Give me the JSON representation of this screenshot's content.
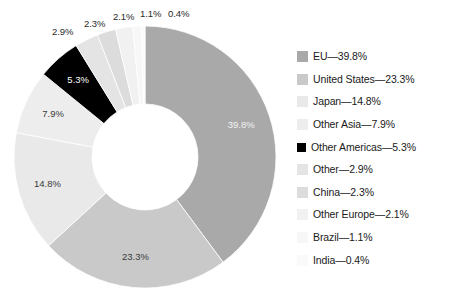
{
  "chart_data": {
    "type": "pie",
    "variant": "donut",
    "title": "",
    "subtitle": "",
    "xlabel": "",
    "ylabel": "",
    "grid": false,
    "legend_position": "right",
    "unit": "%",
    "start_angle_deg": 0,
    "direction": "clockwise",
    "categories": [
      "EU",
      "United States",
      "Japan",
      "Other Asia",
      "Other Americas",
      "Other",
      "China",
      "Other Europe",
      "Brazil",
      "India"
    ],
    "values": [
      39.8,
      23.3,
      14.8,
      7.9,
      5.3,
      2.9,
      2.3,
      2.1,
      1.1,
      0.4
    ],
    "value_labels": [
      "39.8%",
      "23.3%",
      "14.8%",
      "7.9%",
      "5.3%",
      "2.9%",
      "2.3%",
      "2.1%",
      "1.1%",
      "0.4%"
    ],
    "colors": [
      "#a9a9a9",
      "#c9c9c9",
      "#e9e9e9",
      "#ededed",
      "#000000",
      "#e4e4e4",
      "#dcdcdc",
      "#f1f1f1",
      "#f7f7f7",
      "#fafafa"
    ],
    "legend_entries": [
      "EU—39.8%",
      "United States—23.3%",
      "Japan—14.8%",
      "Other Asia—7.9%",
      "Other Americas—5.3%",
      "Other—2.9%",
      "China—2.3%",
      "Other Europe—2.1%",
      "Brazil—1.1%",
      "India—0.4%"
    ]
  },
  "legend": {
    "items": [
      {
        "label": "EU—39.8%",
        "color": "#a9a9a9"
      },
      {
        "label": "United States—23.3%",
        "color": "#c9c9c9"
      },
      {
        "label": "Japan—14.8%",
        "color": "#e9e9e9"
      },
      {
        "label": "Other Asia—7.9%",
        "color": "#ededed"
      },
      {
        "label": "Other Americas—5.3%",
        "color": "#000000"
      },
      {
        "label": "Other—2.9%",
        "color": "#e4e4e4"
      },
      {
        "label": "China—2.3%",
        "color": "#dcdcdc"
      },
      {
        "label": "Other Europe—2.1%",
        "color": "#f1f1f1"
      },
      {
        "label": "Brazil—1.1%",
        "color": "#f7f7f7"
      },
      {
        "label": "India—0.4%",
        "color": "#fafafa"
      }
    ]
  },
  "slice_labels_inside": [
    {
      "text": "39.8%",
      "style": "on-mid"
    },
    {
      "text": "23.3%",
      "style": "dark"
    },
    {
      "text": "14.8%",
      "style": "dark"
    },
    {
      "text": "7.9%",
      "style": "dark"
    },
    {
      "text": "5.3%",
      "style": "on-dark"
    }
  ],
  "slice_labels_outside": [
    {
      "text": "2.9%"
    },
    {
      "text": "2.3%"
    },
    {
      "text": "2.1%"
    },
    {
      "text": "1.1%"
    },
    {
      "text": "0.4%"
    }
  ]
}
